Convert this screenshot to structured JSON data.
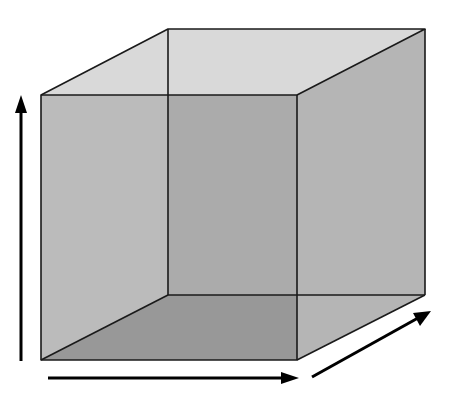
{
  "diagram": {
    "title": "",
    "type": "3D cube with three axis arrows",
    "colors": {
      "background": "#ffffff",
      "top_face": "#d9d9d9",
      "left_face": "#c2c2c2",
      "right_face": "#b5b5b5",
      "back_face": "#a9a9a9",
      "bottom_face": "#8d8d8d",
      "edge": "#1a1a1a",
      "arrow": "#000000"
    },
    "vertices": {
      "front_top_left": [
        41,
        95
      ],
      "front_top_right": [
        297,
        95
      ],
      "front_bottom_left": [
        41,
        360
      ],
      "front_bottom_right": [
        297,
        360
      ],
      "back_top_left": [
        168,
        29
      ],
      "back_top_right": [
        425,
        29
      ],
      "back_bottom_left": [
        168,
        295
      ],
      "back_bottom_right": [
        425,
        295
      ]
    },
    "arrows": [
      {
        "name": "vertical-axis",
        "direction": "up",
        "from": [
          21,
          361
        ],
        "to": [
          21,
          95
        ]
      },
      {
        "name": "horizontal-axis",
        "direction": "right",
        "from": [
          48,
          378
        ],
        "to": [
          298,
          378
        ]
      },
      {
        "name": "depth-axis",
        "direction": "diagonal-up-right",
        "from": [
          312,
          377
        ],
        "to": [
          430,
          312
        ]
      }
    ],
    "labels": []
  }
}
